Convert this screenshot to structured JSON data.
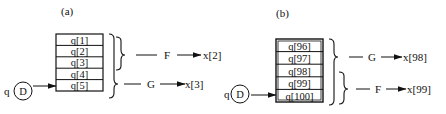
{
  "panels": [
    {
      "label": "(a)",
      "source": {
        "prefix": "q",
        "node": "D"
      },
      "queue": [
        "q[1]",
        "q[2]",
        "q[3]",
        "q[4]",
        "q[5]"
      ],
      "groups": [
        {
          "span": "q[1]–q[3]",
          "function": "F",
          "output": "x[2]"
        },
        {
          "span": "q[1]–q[5]",
          "function": "G",
          "output": "x[3]"
        }
      ]
    },
    {
      "label": "(b)",
      "source": {
        "prefix": "q",
        "node": "D"
      },
      "queue": [
        "q[96]",
        "q[97]",
        "q[98]",
        "q[99]",
        "q[100]"
      ],
      "groups": [
        {
          "span": "q[96]–q[100]",
          "function": "G",
          "output": "x[98]"
        },
        {
          "span": "q[98]–q[100]",
          "function": "F",
          "output": "x[99]"
        }
      ]
    }
  ]
}
